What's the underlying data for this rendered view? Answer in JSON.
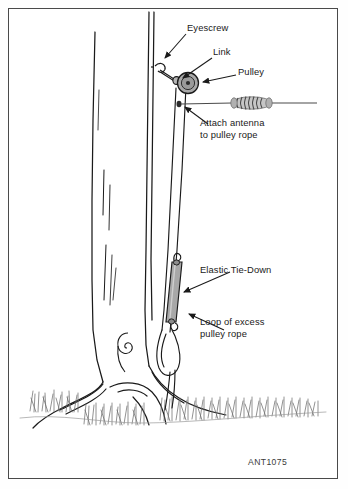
{
  "figure": {
    "reference_code": "ANT1075",
    "border_color": "#4a4a4a",
    "ink_color": "#1a1a1a",
    "part_fill_color": "#a8a8a8",
    "grass_color": "#6d6d6d"
  },
  "labels": {
    "eyescrew": "Eyescrew",
    "link": "Link",
    "pulley": "Pulley",
    "attach_antenna_line1": "Attach antenna",
    "attach_antenna_line2": "to pulley rope",
    "elastic_tie_down": "Elastic Tie-Down",
    "loop_line1": "Loop of excess",
    "loop_line2": "pulley rope"
  },
  "parts": {
    "eyescrew_name": "eyescrew",
    "link_name": "link",
    "pulley_name": "pulley",
    "antenna_coil_name": "antenna-loading-coil",
    "elastic_name": "elastic-tie-down",
    "rope_name": "pulley-rope",
    "tree_name": "tree-trunk",
    "ground_name": "ground-grass"
  }
}
